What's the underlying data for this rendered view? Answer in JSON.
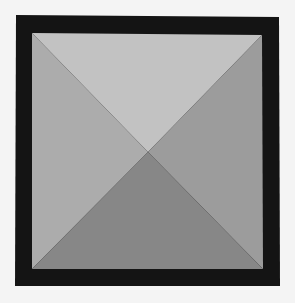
{
  "figure": {
    "colors": {
      "background": "#f4f4f4",
      "frame": "#141414",
      "face_top": "#c2c2c2",
      "face_left": "#acacac",
      "face_right": "#9c9c9c",
      "face_bottom": "#878787"
    }
  }
}
